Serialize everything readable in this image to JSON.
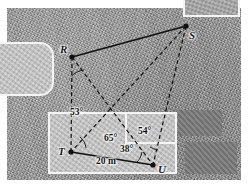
{
  "figure": {
    "type": "survey-diagram",
    "caption_present": false,
    "background": "aerial-photograph",
    "colors": {
      "ground": "#9d9d9d",
      "roof_light": "#c4c4c4",
      "roof_mid": "#a7a7a7",
      "roof_dark": "#7d7d7d",
      "outline": "#f4f4f4",
      "line": "#111111",
      "label": "#141414"
    }
  },
  "points": [
    {
      "id": "R",
      "label": "R",
      "x": 72,
      "y": 57
    },
    {
      "id": "S",
      "label": "S",
      "x": 186,
      "y": 26
    },
    {
      "id": "T",
      "label": "T",
      "x": 71,
      "y": 152
    },
    {
      "id": "U",
      "label": "U",
      "x": 153,
      "y": 165
    }
  ],
  "segments": [
    {
      "from": "R",
      "to": "S",
      "style": "solid"
    },
    {
      "from": "T",
      "to": "U",
      "style": "solid"
    },
    {
      "from": "R",
      "to": "T",
      "style": "dashed"
    },
    {
      "from": "R",
      "to": "U",
      "style": "dashed"
    },
    {
      "from": "S",
      "to": "T",
      "style": "dashed"
    },
    {
      "from": "S",
      "to": "U",
      "style": "dashed"
    }
  ],
  "angles": [
    {
      "id": "a53",
      "label": "53°",
      "value": 53,
      "unit": "degrees",
      "at": "R"
    },
    {
      "id": "a65",
      "label": "65°",
      "value": 65,
      "unit": "degrees",
      "at": "T"
    },
    {
      "id": "a38",
      "label": "38°",
      "value": 38,
      "unit": "degrees",
      "at": "U"
    },
    {
      "id": "a54",
      "label": "54°",
      "value": 54,
      "unit": "degrees",
      "at": "U"
    }
  ],
  "measurements": [
    {
      "id": "TU",
      "label": "20 m",
      "value": 20,
      "unit": "m",
      "between": "T-U"
    }
  ],
  "buildings": [
    {
      "id": "left-building",
      "shape": "rounded-rect",
      "tone": "roof_light"
    },
    {
      "id": "top-right-building",
      "shape": "rect",
      "tone": "roof_mid"
    },
    {
      "id": "bottom-building",
      "shape": "stepped-rect",
      "tone": "roof_light"
    },
    {
      "id": "dark-patch-upper",
      "shape": "rect",
      "tone": "roof_dark"
    },
    {
      "id": "dark-patch-lower",
      "shape": "rect",
      "tone": "roof_dark"
    }
  ]
}
